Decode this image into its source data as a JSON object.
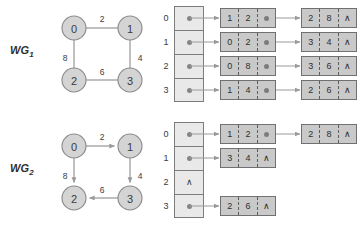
{
  "figure": {
    "colors": {
      "node_fill": "#d4d4d4",
      "node_stroke": "#8a8a8a",
      "index_cell_fill": "#e9e9e9",
      "list_cell_fill": "#c9c9c9",
      "cell_stroke": "#707070",
      "arrow": "#9a9a9a",
      "text": "#3a3a3a",
      "background": "#ffffff"
    },
    "null_symbol": "∧"
  },
  "blocks": [
    {
      "id": "wg1",
      "label_main": "WG",
      "label_sub": "1",
      "graph": {
        "directed": false,
        "nodes": [
          {
            "id": "0",
            "label": "0",
            "cx": 22,
            "cy": 22
          },
          {
            "id": "1",
            "label": "1",
            "cx": 78,
            "cy": 22
          },
          {
            "id": "2",
            "label": "2",
            "cx": 22,
            "cy": 74
          },
          {
            "id": "3",
            "label": "3",
            "cx": 78,
            "cy": 74
          }
        ],
        "edges": [
          {
            "from": "0",
            "to": "1",
            "weight": "2",
            "wx": 50,
            "wy": 13
          },
          {
            "from": "0",
            "to": "2",
            "weight": "8",
            "wx": 13,
            "wy": 52
          },
          {
            "from": "2",
            "to": "3",
            "weight": "6",
            "wx": 50,
            "wy": 66
          },
          {
            "from": "1",
            "to": "3",
            "weight": "4",
            "wx": 88,
            "wy": 52
          }
        ]
      },
      "adjacency": {
        "index_labels": [
          "0",
          "1",
          "2",
          "3"
        ],
        "rows": [
          {
            "index": "0",
            "head": "pointer",
            "nodes": [
              {
                "vertex": "1",
                "weight": "2",
                "link": "pointer"
              },
              {
                "vertex": "2",
                "weight": "8",
                "link": "null"
              }
            ]
          },
          {
            "index": "1",
            "head": "pointer",
            "nodes": [
              {
                "vertex": "0",
                "weight": "2",
                "link": "pointer"
              },
              {
                "vertex": "3",
                "weight": "4",
                "link": "null"
              }
            ]
          },
          {
            "index": "2",
            "head": "pointer",
            "nodes": [
              {
                "vertex": "0",
                "weight": "8",
                "link": "pointer"
              },
              {
                "vertex": "3",
                "weight": "6",
                "link": "null"
              }
            ]
          },
          {
            "index": "3",
            "head": "pointer",
            "nodes": [
              {
                "vertex": "1",
                "weight": "4",
                "link": "pointer"
              },
              {
                "vertex": "2",
                "weight": "6",
                "link": "null"
              }
            ]
          }
        ]
      }
    },
    {
      "id": "wg2",
      "label_main": "WG",
      "label_sub": "2",
      "graph": {
        "directed": true,
        "nodes": [
          {
            "id": "0",
            "label": "0",
            "cx": 22,
            "cy": 22
          },
          {
            "id": "1",
            "label": "1",
            "cx": 78,
            "cy": 22
          },
          {
            "id": "2",
            "label": "2",
            "cx": 22,
            "cy": 74
          },
          {
            "id": "3",
            "label": "3",
            "cx": 78,
            "cy": 74
          }
        ],
        "edges": [
          {
            "from": "0",
            "to": "1",
            "weight": "2",
            "wx": 50,
            "wy": 13
          },
          {
            "from": "0",
            "to": "2",
            "weight": "8",
            "wx": 13,
            "wy": 52
          },
          {
            "from": "3",
            "to": "2",
            "weight": "6",
            "wx": 50,
            "wy": 66
          },
          {
            "from": "1",
            "to": "3",
            "weight": "4",
            "wx": 88,
            "wy": 52
          }
        ]
      },
      "adjacency": {
        "index_labels": [
          "0",
          "1",
          "2",
          "3"
        ],
        "rows": [
          {
            "index": "0",
            "head": "pointer",
            "nodes": [
              {
                "vertex": "1",
                "weight": "2",
                "link": "pointer"
              },
              {
                "vertex": "2",
                "weight": "8",
                "link": "null"
              }
            ]
          },
          {
            "index": "1",
            "head": "pointer",
            "nodes": [
              {
                "vertex": "3",
                "weight": "4",
                "link": "null"
              }
            ]
          },
          {
            "index": "2",
            "head": "null",
            "nodes": []
          },
          {
            "index": "3",
            "head": "pointer",
            "nodes": [
              {
                "vertex": "2",
                "weight": "6",
                "link": "null"
              }
            ]
          }
        ]
      }
    }
  ]
}
